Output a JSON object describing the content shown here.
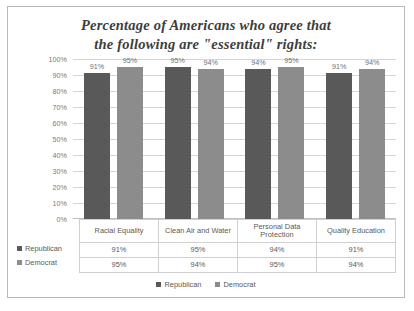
{
  "chart_data": {
    "type": "bar",
    "title": "Percentage of Americans who agree that the following are \"essential\" rights:",
    "title_line1": "Percentage of Americans who agree that",
    "title_line2": "the following are \"essential\" rights:",
    "xlabel": "",
    "ylabel": "",
    "ylim": [
      0,
      100
    ],
    "grid": true,
    "legend_position": "bottom",
    "categories": [
      "Racial Equality",
      "Clean Air and Water",
      "Personal Data Protection",
      "Quality Education"
    ],
    "series": [
      {
        "name": "Republican",
        "color": "#595959",
        "values": [
          91,
          95,
          94,
          91
        ],
        "value_labels": [
          "91%",
          "95%",
          "94%",
          "91%"
        ]
      },
      {
        "name": "Democrat",
        "color": "#8c8c8c",
        "values": [
          95,
          94,
          95,
          94
        ],
        "value_labels": [
          "95%",
          "94%",
          "95%",
          "94%"
        ]
      }
    ],
    "y_ticks": [
      "100%",
      "90%",
      "80%",
      "70%",
      "60%",
      "50%",
      "40%",
      "30%",
      "20%",
      "10%",
      "0%"
    ],
    "y_tick_values": [
      100,
      90,
      80,
      70,
      60,
      50,
      40,
      30,
      20,
      10,
      0
    ]
  },
  "data_table": {
    "row_labels": [
      "Republican",
      "Democrat"
    ],
    "columns": [
      "Racial Equality",
      "Clean Air and Water",
      "Personal Data Protection",
      "Quality Education"
    ],
    "rows": [
      [
        "91%",
        "95%",
        "94%",
        "91%"
      ],
      [
        "95%",
        "94%",
        "95%",
        "94%"
      ]
    ]
  },
  "legend": {
    "items": [
      {
        "label": "Republican",
        "color": "#595959"
      },
      {
        "label": "Democrat",
        "color": "#8c8c8c"
      }
    ]
  }
}
